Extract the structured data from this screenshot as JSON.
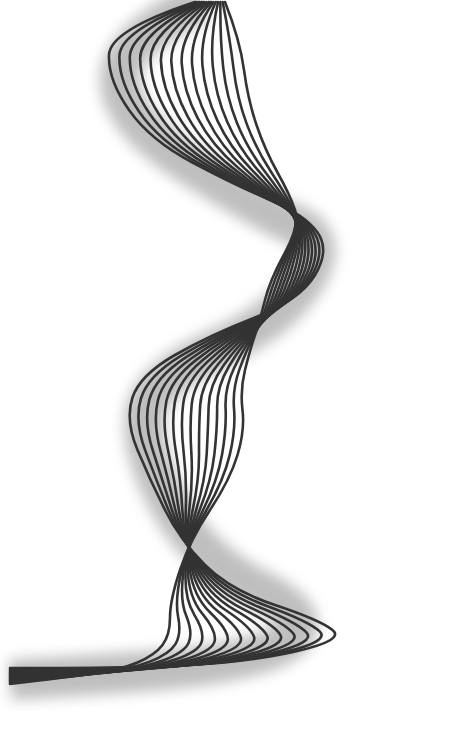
{
  "artwork": {
    "description": "Abstract line-art ribbon of offset curves twisting vertically with soft shadow",
    "line_color": "#333333",
    "shadow_color": "#8a8a8a",
    "background": "#ffffff",
    "line_count": 14,
    "line_width": 2.6,
    "spine": [
      [
        205,
        0
      ],
      [
        150,
        40
      ],
      [
        160,
        130
      ],
      [
        265,
        200
      ],
      [
        310,
        260
      ],
      [
        270,
        330
      ],
      [
        180,
        370
      ],
      [
        170,
        420
      ],
      [
        210,
        480
      ],
      [
        230,
        540
      ],
      [
        260,
        600
      ],
      [
        200,
        640
      ],
      [
        100,
        665
      ],
      [
        10,
        675
      ]
    ]
  }
}
